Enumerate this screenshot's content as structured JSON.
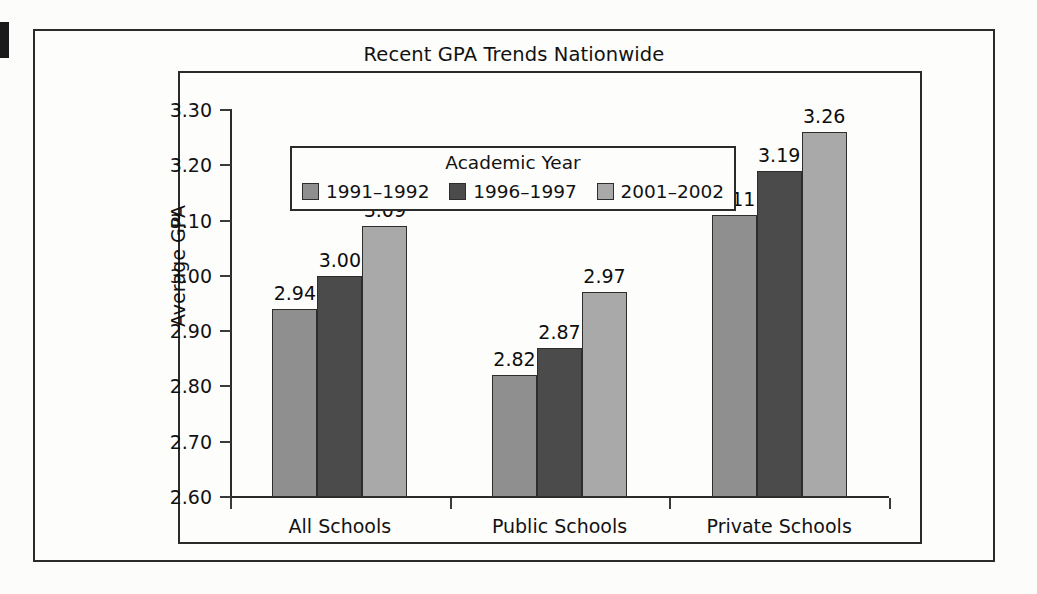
{
  "figure": {
    "title": "Recent GPA Trends Nationwide",
    "y_axis_title": "Average GPA",
    "legend_title": "Academic Year"
  },
  "chart_data": {
    "type": "bar",
    "title": "Recent GPA Trends Nationwide",
    "xlabel": "",
    "ylabel": "Average GPA",
    "ylim": [
      2.6,
      3.3
    ],
    "ytick_labels": [
      "3.30",
      "3.20",
      "3.10",
      "3.00",
      "2.90",
      "2.80",
      "2.70",
      "2.60"
    ],
    "ytick_values": [
      3.3,
      3.2,
      3.1,
      3.0,
      2.9,
      2.8,
      2.7,
      2.6
    ],
    "grid": false,
    "legend_position": "upper-left-inside",
    "categories": [
      "All Schools",
      "Public Schools",
      "Private Schools"
    ],
    "series": [
      {
        "name": "1991–1992",
        "color": "#8f8f8f",
        "values": [
          2.94,
          3.11,
          2.82
        ],
        "labels": [
          "2.94",
          "2.82",
          "3.11"
        ]
      },
      {
        "name": "1996–1997",
        "color": "#4b4b4b",
        "values": [
          3.0,
          2.87,
          3.19
        ],
        "labels": [
          "3.00",
          "2.87",
          "3.19"
        ]
      },
      {
        "name": "2001–2002",
        "color": "#a9a9a9",
        "values": [
          3.09,
          2.97,
          3.26
        ],
        "labels": [
          "3.09",
          "2.97",
          "3.26"
        ]
      }
    ],
    "bars": [
      {
        "category": "All Schools",
        "series": "1991–1992",
        "value": 2.94,
        "label": "2.94"
      },
      {
        "category": "All Schools",
        "series": "1996–1997",
        "value": 3.0,
        "label": "3.00"
      },
      {
        "category": "All Schools",
        "series": "2001–2002",
        "value": 3.09,
        "label": "3.09"
      },
      {
        "category": "Public Schools",
        "series": "1991–1992",
        "value": 2.82,
        "label": "2.82"
      },
      {
        "category": "Public Schools",
        "series": "1996–1997",
        "value": 2.87,
        "label": "2.87"
      },
      {
        "category": "Public Schools",
        "series": "2001–2002",
        "value": 2.97,
        "label": "2.97"
      },
      {
        "category": "Private Schools",
        "series": "1991–1992",
        "value": 3.11,
        "label": "3.11"
      },
      {
        "category": "Private Schools",
        "series": "1996–1997",
        "value": 3.19,
        "label": "3.19"
      },
      {
        "category": "Private Schools",
        "series": "2001–2002",
        "value": 3.26,
        "label": "3.26"
      }
    ]
  },
  "colors": {
    "frame": "#2b2b2b",
    "text": "#121212",
    "background": "#fdfdfc",
    "series_1": "#8f8f8f",
    "series_2": "#4b4b4b",
    "series_3": "#a9a9a9"
  }
}
